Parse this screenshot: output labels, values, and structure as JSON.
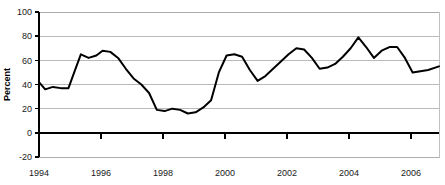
{
  "chart_data": {
    "type": "line",
    "title": "",
    "subtitle": "",
    "xlabel": "",
    "ylabel": "Percent",
    "ylim": [
      -20,
      100
    ],
    "xlim": [
      1994.0,
      2006.9
    ],
    "ytick_labels": [
      "100",
      "80",
      "60",
      "40",
      "20",
      "0",
      "-20"
    ],
    "ytick_values": [
      100,
      80,
      60,
      40,
      20,
      0,
      -20
    ],
    "xtick_labels": [
      "1994",
      "1996",
      "1998",
      "2000",
      "2002",
      "2004",
      "2006"
    ],
    "xtick_values": [
      1994,
      1996,
      1998,
      2000,
      2002,
      2004,
      2006
    ],
    "grid": true,
    "grid_axis": "y",
    "legend": false,
    "legend_position": "none",
    "line_color": "#000000",
    "grid_color": "#a8a8a8",
    "zero_line_color": "#000000",
    "series": [
      {
        "name": "Percent",
        "x": [
          1994.0,
          1994.25,
          1994.5,
          1994.75,
          1995.0,
          1995.25,
          1995.5,
          1995.75,
          1996.0,
          1996.25,
          1996.5,
          1996.75,
          1997.0,
          1997.25,
          1997.5,
          1997.75,
          1998.0,
          1998.25,
          1998.5,
          1998.75,
          1999.0,
          1999.25,
          1999.5,
          1999.75,
          2000.0,
          2000.25,
          2000.5,
          2000.75,
          2001.0,
          2001.25,
          2001.5,
          2001.75,
          2002.0,
          2002.25,
          2002.5,
          2002.75,
          2003.0,
          2003.25,
          2003.5,
          2003.75,
          2004.0,
          2004.25,
          2004.5,
          2004.75,
          2005.0,
          2005.25,
          2005.5,
          2005.75,
          2006.0,
          2006.25,
          2006.5,
          2006.9
        ],
        "values": [
          42,
          36,
          38,
          37,
          37,
          58,
          65,
          62,
          65,
          68,
          65,
          62,
          48,
          42,
          33,
          19,
          18,
          20,
          19,
          16,
          17,
          18,
          26,
          50,
          64,
          65,
          64,
          58,
          43,
          53,
          62,
          69,
          70,
          62,
          54,
          53,
          58,
          62,
          68,
          79,
          71,
          62,
          68,
          71,
          71,
          61,
          50,
          52,
          58,
          68,
          73,
          81
        ]
      }
    ],
    "data_points_extended": {
      "comment_not_rendered": false,
      "full_x": [
        1994.0,
        1994.2,
        1994.45,
        1994.7,
        1994.95,
        1995.15,
        1995.35,
        1995.6,
        1995.85,
        1996.05,
        1996.3,
        1996.55,
        1996.8,
        1997.05,
        1997.3,
        1997.55,
        1997.8,
        1998.05,
        1998.3,
        1998.55,
        1998.8,
        1999.05,
        1999.3,
        1999.55,
        1999.8,
        2000.05,
        2000.3,
        2000.55,
        2000.8,
        2001.05,
        2001.3,
        2001.55,
        2001.8,
        2002.05,
        2002.3,
        2002.55,
        2002.8,
        2003.05,
        2003.3,
        2003.55,
        2003.8,
        2004.05,
        2004.3,
        2004.55,
        2004.8,
        2005.05,
        2005.3,
        2005.55,
        2005.8,
        2006.05,
        2006.3,
        2006.55,
        2006.9
      ],
      "full_y": [
        42,
        36,
        38,
        37,
        37,
        51,
        65,
        62,
        64,
        68,
        67,
        62,
        53,
        45,
        40,
        33,
        19,
        18,
        20,
        19,
        16,
        17,
        21,
        27,
        50,
        64,
        65,
        63,
        52,
        43,
        47,
        53,
        59,
        65,
        70,
        69,
        62,
        53,
        54,
        57,
        63,
        70,
        79,
        71,
        62,
        68,
        71,
        71,
        62,
        50,
        51,
        52,
        55
      ]
    }
  }
}
